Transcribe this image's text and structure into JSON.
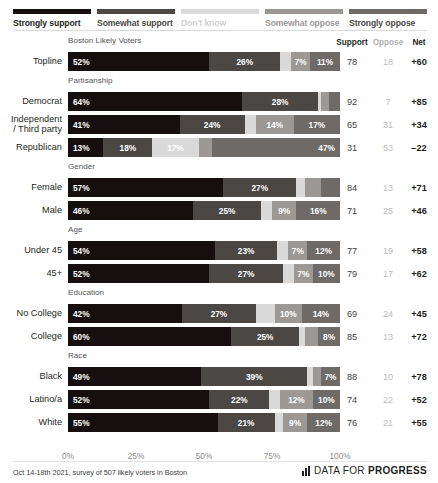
{
  "colors": {
    "strongly_support": "#15100f",
    "somewhat_support": "#4a4745",
    "dont_know": "#d9d9d9",
    "somewhat_oppose": "#9b9896",
    "strongly_oppose": "#6d6a68",
    "label_light": "#ffffff",
    "net_positive": "#231f20"
  },
  "legend": [
    {
      "label": "Strongly support",
      "key": "strongly_support",
      "color": "#15100f",
      "text_color": "#231f20"
    },
    {
      "label": "Somewhat support",
      "key": "somewhat_support",
      "color": "#4a4745",
      "text_color": "#4a4745"
    },
    {
      "label": "Don't know",
      "key": "dont_know",
      "color": "#d9d9d9",
      "text_color": "#cfcfcf"
    },
    {
      "label": "Somewhat oppose",
      "key": "somewhat_oppose",
      "color": "#9b9896",
      "text_color": "#9b9896"
    },
    {
      "label": "Strongly oppose",
      "key": "strongly_oppose",
      "color": "#6d6a68",
      "text_color": "#4a4745"
    }
  ],
  "column_headers": {
    "support": "Support",
    "oppose": "Oppose",
    "net": "Net"
  },
  "chart_data": {
    "type": "bar",
    "subtype": "stacked-horizontal-diverging",
    "title": "Boston Likely Voters",
    "xlabel": "",
    "ylabel": "",
    "xlim": [
      0,
      100
    ],
    "grid": false,
    "legend_position": "top",
    "categories": [
      "Topline",
      "Democrat",
      "Independent / Third party",
      "Republican",
      "Female",
      "Male",
      "Under 45",
      "45+",
      "No College",
      "College",
      "Black",
      "Latino/a",
      "White"
    ],
    "series": [
      {
        "name": "Strongly support",
        "values": [
          52,
          64,
          41,
          13,
          57,
          46,
          54,
          52,
          42,
          60,
          49,
          52,
          55
        ]
      },
      {
        "name": "Somewhat support",
        "values": [
          26,
          28,
          24,
          18,
          27,
          25,
          23,
          27,
          27,
          25,
          39,
          22,
          21
        ]
      },
      {
        "name": "Don't know",
        "values": [
          4,
          1,
          4,
          17,
          3,
          4,
          4,
          4,
          7,
          2,
          2,
          4,
          3
        ]
      },
      {
        "name": "Somewhat oppose",
        "values": [
          7,
          3,
          14,
          5,
          6,
          9,
          7,
          7,
          10,
          5,
          3,
          12,
          9
        ]
      },
      {
        "name": "Strongly oppose",
        "values": [
          11,
          4,
          17,
          47,
          7,
          16,
          12,
          10,
          14,
          8,
          7,
          10,
          12
        ]
      }
    ],
    "summary": {
      "support": [
        78,
        92,
        65,
        31,
        84,
        71,
        77,
        79,
        69,
        85,
        88,
        74,
        76
      ],
      "oppose": [
        18,
        7,
        31,
        53,
        13,
        25,
        19,
        17,
        24,
        13,
        10,
        22,
        21
      ],
      "net": [
        "+60",
        "+85",
        "+34",
        "–22",
        "+71",
        "+46",
        "+58",
        "+62",
        "+45",
        "+72",
        "+78",
        "+52",
        "+55"
      ]
    },
    "xticks": [
      0,
      25,
      50,
      75,
      100
    ],
    "xtick_labels": [
      "0%",
      "25%",
      "50%",
      "75%",
      "100%"
    ]
  },
  "groups": [
    {
      "title": "Boston Likely Voters",
      "rows": [
        0
      ]
    },
    {
      "title": "Partisanship",
      "rows": [
        1,
        2,
        3
      ]
    },
    {
      "title": "Gender",
      "rows": [
        4,
        5
      ]
    },
    {
      "title": "Age",
      "rows": [
        6,
        7
      ]
    },
    {
      "title": "Education",
      "rows": [
        8,
        9
      ]
    },
    {
      "title": "Race",
      "rows": [
        10,
        11,
        12
      ]
    }
  ],
  "rows": [
    {
      "label": "Topline",
      "segments": [
        {
          "key": "strongly_support",
          "value": 52,
          "label": "52%",
          "show": true,
          "align": "lead"
        },
        {
          "key": "somewhat_support",
          "value": 26,
          "label": "26%",
          "show": true,
          "align": "mid"
        },
        {
          "key": "dont_know",
          "value": 4,
          "label": "4%",
          "show": false,
          "align": "mid"
        },
        {
          "key": "somewhat_oppose",
          "value": 7,
          "label": "7%",
          "show": true,
          "align": "mid"
        },
        {
          "key": "strongly_oppose",
          "value": 11,
          "label": "11%",
          "show": true,
          "align": "mid"
        }
      ],
      "support": "78",
      "oppose": "18",
      "net": "+60"
    },
    {
      "label": "Democrat",
      "segments": [
        {
          "key": "strongly_support",
          "value": 64,
          "label": "64%",
          "show": true,
          "align": "lead"
        },
        {
          "key": "somewhat_support",
          "value": 28,
          "label": "28%",
          "show": true,
          "align": "mid"
        },
        {
          "key": "dont_know",
          "value": 1,
          "label": "1%",
          "show": false,
          "align": "mid"
        },
        {
          "key": "somewhat_oppose",
          "value": 3,
          "label": "3%",
          "show": false,
          "align": "mid"
        },
        {
          "key": "strongly_oppose",
          "value": 4,
          "label": "4%",
          "show": false,
          "align": "mid"
        }
      ],
      "support": "92",
      "oppose": "7",
      "net": "+85"
    },
    {
      "label": "Independent\n/ Third party",
      "label_line1": "Independent",
      "label_line2": "/ Third party",
      "segments": [
        {
          "key": "strongly_support",
          "value": 41,
          "label": "41%",
          "show": true,
          "align": "lead"
        },
        {
          "key": "somewhat_support",
          "value": 24,
          "label": "24%",
          "show": true,
          "align": "mid"
        },
        {
          "key": "dont_know",
          "value": 4,
          "label": "4%",
          "show": false,
          "align": "mid"
        },
        {
          "key": "somewhat_oppose",
          "value": 14,
          "label": "14%",
          "show": true,
          "align": "mid"
        },
        {
          "key": "strongly_oppose",
          "value": 17,
          "label": "17%",
          "show": true,
          "align": "mid"
        }
      ],
      "support": "65",
      "oppose": "31",
      "net": "+34"
    },
    {
      "label": "Republican",
      "segments": [
        {
          "key": "strongly_support",
          "value": 13,
          "label": "13%",
          "show": true,
          "align": "lead"
        },
        {
          "key": "somewhat_support",
          "value": 18,
          "label": "18%",
          "show": true,
          "align": "mid"
        },
        {
          "key": "dont_know",
          "value": 17,
          "label": "17%",
          "show": true,
          "align": "mid"
        },
        {
          "key": "somewhat_oppose",
          "value": 5,
          "label": "5%",
          "show": false,
          "align": "mid"
        },
        {
          "key": "strongly_oppose",
          "value": 47,
          "label": "47%",
          "show": true,
          "align": "tail"
        }
      ],
      "support": "31",
      "oppose": "53",
      "net": "–22"
    },
    {
      "label": "Female",
      "segments": [
        {
          "key": "strongly_support",
          "value": 57,
          "label": "57%",
          "show": true,
          "align": "lead"
        },
        {
          "key": "somewhat_support",
          "value": 27,
          "label": "27%",
          "show": true,
          "align": "mid"
        },
        {
          "key": "dont_know",
          "value": 3,
          "label": "3%",
          "show": false,
          "align": "mid"
        },
        {
          "key": "somewhat_oppose",
          "value": 6,
          "label": "6%",
          "show": false,
          "align": "mid"
        },
        {
          "key": "strongly_oppose",
          "value": 7,
          "label": "7%",
          "show": false,
          "align": "mid"
        }
      ],
      "support": "84",
      "oppose": "13",
      "net": "+71"
    },
    {
      "label": "Male",
      "segments": [
        {
          "key": "strongly_support",
          "value": 46,
          "label": "46%",
          "show": true,
          "align": "lead"
        },
        {
          "key": "somewhat_support",
          "value": 25,
          "label": "25%",
          "show": true,
          "align": "mid"
        },
        {
          "key": "dont_know",
          "value": 4,
          "label": "4%",
          "show": false,
          "align": "mid"
        },
        {
          "key": "somewhat_oppose",
          "value": 9,
          "label": "9%",
          "show": true,
          "align": "mid"
        },
        {
          "key": "strongly_oppose",
          "value": 16,
          "label": "16%",
          "show": true,
          "align": "mid"
        }
      ],
      "support": "71",
      "oppose": "25",
      "net": "+46"
    },
    {
      "label": "Under 45",
      "segments": [
        {
          "key": "strongly_support",
          "value": 54,
          "label": "54%",
          "show": true,
          "align": "lead"
        },
        {
          "key": "somewhat_support",
          "value": 23,
          "label": "23%",
          "show": true,
          "align": "mid"
        },
        {
          "key": "dont_know",
          "value": 4,
          "label": "4%",
          "show": false,
          "align": "mid"
        },
        {
          "key": "somewhat_oppose",
          "value": 7,
          "label": "7%",
          "show": true,
          "align": "mid"
        },
        {
          "key": "strongly_oppose",
          "value": 12,
          "label": "12%",
          "show": true,
          "align": "mid"
        }
      ],
      "support": "77",
      "oppose": "19",
      "net": "+58"
    },
    {
      "label": "45+",
      "segments": [
        {
          "key": "strongly_support",
          "value": 52,
          "label": "52%",
          "show": true,
          "align": "lead"
        },
        {
          "key": "somewhat_support",
          "value": 27,
          "label": "27%",
          "show": true,
          "align": "mid"
        },
        {
          "key": "dont_know",
          "value": 4,
          "label": "4%",
          "show": false,
          "align": "mid"
        },
        {
          "key": "somewhat_oppose",
          "value": 7,
          "label": "7%",
          "show": true,
          "align": "mid"
        },
        {
          "key": "strongly_oppose",
          "value": 10,
          "label": "10%",
          "show": true,
          "align": "mid"
        }
      ],
      "support": "79",
      "oppose": "17",
      "net": "+62"
    },
    {
      "label": "No College",
      "segments": [
        {
          "key": "strongly_support",
          "value": 42,
          "label": "42%",
          "show": true,
          "align": "lead"
        },
        {
          "key": "somewhat_support",
          "value": 27,
          "label": "27%",
          "show": true,
          "align": "mid"
        },
        {
          "key": "dont_know",
          "value": 7,
          "label": "7%",
          "show": false,
          "align": "mid"
        },
        {
          "key": "somewhat_oppose",
          "value": 10,
          "label": "10%",
          "show": true,
          "align": "mid"
        },
        {
          "key": "strongly_oppose",
          "value": 14,
          "label": "14%",
          "show": true,
          "align": "mid"
        }
      ],
      "support": "69",
      "oppose": "24",
      "net": "+45"
    },
    {
      "label": "College",
      "segments": [
        {
          "key": "strongly_support",
          "value": 60,
          "label": "60%",
          "show": true,
          "align": "lead"
        },
        {
          "key": "somewhat_support",
          "value": 25,
          "label": "25%",
          "show": true,
          "align": "mid"
        },
        {
          "key": "dont_know",
          "value": 2,
          "label": "2%",
          "show": false,
          "align": "mid"
        },
        {
          "key": "somewhat_oppose",
          "value": 5,
          "label": "5%",
          "show": false,
          "align": "mid"
        },
        {
          "key": "strongly_oppose",
          "value": 8,
          "label": "8%",
          "show": true,
          "align": "mid"
        }
      ],
      "support": "85",
      "oppose": "13",
      "net": "+72"
    },
    {
      "label": "Black",
      "segments": [
        {
          "key": "strongly_support",
          "value": 49,
          "label": "49%",
          "show": true,
          "align": "lead"
        },
        {
          "key": "somewhat_support",
          "value": 39,
          "label": "39%",
          "show": true,
          "align": "mid"
        },
        {
          "key": "dont_know",
          "value": 2,
          "label": "2%",
          "show": false,
          "align": "mid"
        },
        {
          "key": "somewhat_oppose",
          "value": 3,
          "label": "3%",
          "show": false,
          "align": "mid"
        },
        {
          "key": "strongly_oppose",
          "value": 7,
          "label": "7%",
          "show": true,
          "align": "mid"
        }
      ],
      "support": "88",
      "oppose": "10",
      "net": "+78"
    },
    {
      "label": "Latino/a",
      "segments": [
        {
          "key": "strongly_support",
          "value": 52,
          "label": "52%",
          "show": true,
          "align": "lead"
        },
        {
          "key": "somewhat_support",
          "value": 22,
          "label": "22%",
          "show": true,
          "align": "mid"
        },
        {
          "key": "dont_know",
          "value": 4,
          "label": "4%",
          "show": false,
          "align": "mid"
        },
        {
          "key": "somewhat_oppose",
          "value": 12,
          "label": "12%",
          "show": true,
          "align": "mid"
        },
        {
          "key": "strongly_oppose",
          "value": 10,
          "label": "10%",
          "show": true,
          "align": "mid"
        }
      ],
      "support": "74",
      "oppose": "22",
      "net": "+52"
    },
    {
      "label": "White",
      "segments": [
        {
          "key": "strongly_support",
          "value": 55,
          "label": "55%",
          "show": true,
          "align": "lead"
        },
        {
          "key": "somewhat_support",
          "value": 21,
          "label": "21%",
          "show": true,
          "align": "mid"
        },
        {
          "key": "dont_know",
          "value": 3,
          "label": "3%",
          "show": false,
          "align": "mid"
        },
        {
          "key": "somewhat_oppose",
          "value": 9,
          "label": "9%",
          "show": true,
          "align": "mid"
        },
        {
          "key": "strongly_oppose",
          "value": 12,
          "label": "12%",
          "show": true,
          "align": "mid"
        }
      ],
      "support": "76",
      "oppose": "21",
      "net": "+55"
    }
  ],
  "axis": {
    "ticks": [
      "0%",
      "25%",
      "50%",
      "75%",
      "100%"
    ]
  },
  "footer": {
    "note": "Oct 14-18th 2021, survey of 507 likely voters in Boston",
    "brand_light": "DATA FOR ",
    "brand_bold": "PROGRESS"
  }
}
